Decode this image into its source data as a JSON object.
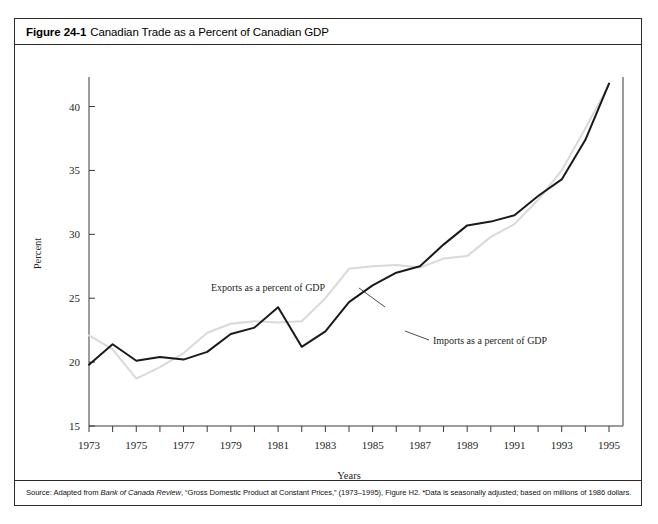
{
  "figure": {
    "number": "Figure 24-1",
    "title": "Canadian Trade as a Percent of Canadian GDP",
    "source_prefix": "Source: Adapted from ",
    "source_italic": "Bank of Canada Review",
    "source_rest": ", “Gross Domestic Product at Constant Prices,” (1973–1995), Figure H2. *Data is seasonally adjusted; based on millions of 1986 dollars."
  },
  "colors": {
    "imports_line": "#1a1a1a",
    "exports_line": "#d9d9d9",
    "axis": "#3a3a3a",
    "text": "#231f20",
    "border": "#2b2b2b",
    "background": "#ffffff"
  },
  "chart_data": {
    "type": "line",
    "title": "Canadian Trade as a Percent of Canadian GDP",
    "xlabel": "Years",
    "ylabel": "Percent",
    "xlim": [
      1973,
      1995
    ],
    "ylim": [
      15,
      42
    ],
    "yticks": [
      15,
      20,
      25,
      30,
      35,
      40
    ],
    "xticks": [
      1973,
      1975,
      1977,
      1979,
      1981,
      1983,
      1985,
      1987,
      1989,
      1991,
      1993,
      1995
    ],
    "xtick_minor_step": 1,
    "grid": false,
    "legend": "annotations",
    "x": [
      1973,
      1974,
      1975,
      1976,
      1977,
      1978,
      1979,
      1980,
      1981,
      1982,
      1983,
      1984,
      1985,
      1986,
      1987,
      1988,
      1989,
      1990,
      1991,
      1992,
      1993,
      1994,
      1995
    ],
    "series": [
      {
        "name": "Imports as a percent of GDP",
        "color": "#1a1a1a",
        "annotation": "Imports as a percent of GDP",
        "values": [
          19.8,
          21.4,
          20.1,
          20.4,
          20.2,
          20.8,
          22.2,
          22.7,
          24.3,
          21.2,
          22.4,
          24.7,
          26.0,
          27.0,
          27.5,
          29.2,
          30.7,
          31.0,
          31.5,
          33.0,
          34.3,
          37.4,
          41.8
        ]
      },
      {
        "name": "Exports as a percent of GDP",
        "color": "#d9d9d9",
        "annotation": "Exports as a percent of GDP",
        "values": [
          22.1,
          21.0,
          18.7,
          19.6,
          20.7,
          22.3,
          23.0,
          23.2,
          23.1,
          23.2,
          25.0,
          27.3,
          27.5,
          27.6,
          27.4,
          28.1,
          28.3,
          29.8,
          30.8,
          32.7,
          35.0,
          38.3,
          41.7
        ]
      }
    ],
    "annotations": [
      {
        "text": "Exports as a percent of GDP",
        "text_x": 196,
        "text_y": 246,
        "leader": "M 344 243 L 370 262"
      },
      {
        "text": "Imports as a percent of GDP",
        "text_x": 418,
        "text_y": 299,
        "leader": "M 390 286 L 414 295"
      }
    ]
  }
}
